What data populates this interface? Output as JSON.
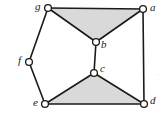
{
  "figure": {
    "kind": "planar-graph-drawing",
    "width": 167,
    "height": 120,
    "background_color": "#ffffff",
    "edge_color": "#1a1a1a",
    "node_fill_color": "#ffffff",
    "node_stroke_color": "#1a1a1a",
    "shade_color": "#d9d9d9"
  },
  "nodes": [
    {
      "id": "g",
      "label": "g",
      "x": 48,
      "y": 8,
      "r": 3.4,
      "label_x": 35,
      "label_y": 1
    },
    {
      "id": "a",
      "label": "a",
      "x": 143,
      "y": 9,
      "r": 3.4,
      "label_x": 150,
      "label_y": 2
    },
    {
      "id": "b",
      "label": "b",
      "x": 96,
      "y": 42,
      "r": 3.4,
      "label_x": 101,
      "label_y": 39
    },
    {
      "id": "f",
      "label": "f",
      "x": 29,
      "y": 62,
      "r": 3.4,
      "label_x": 18,
      "label_y": 55
    },
    {
      "id": "c",
      "label": "c",
      "x": 94,
      "y": 73,
      "r": 3.4,
      "label_x": 100,
      "label_y": 63
    },
    {
      "id": "e",
      "label": "e",
      "x": 45,
      "y": 104,
      "r": 3.4,
      "label_x": 33,
      "label_y": 97
    },
    {
      "id": "d",
      "label": "d",
      "x": 144,
      "y": 104,
      "r": 3.4,
      "label_x": 150,
      "label_y": 95
    }
  ],
  "edges": [
    {
      "id": "g-a",
      "from": "g",
      "to": "a"
    },
    {
      "id": "g-b",
      "from": "g",
      "to": "b"
    },
    {
      "id": "a-b",
      "from": "a",
      "to": "b"
    },
    {
      "id": "b-c",
      "from": "b",
      "to": "c"
    },
    {
      "id": "c-e",
      "from": "c",
      "to": "e"
    },
    {
      "id": "c-d",
      "from": "c",
      "to": "d"
    },
    {
      "id": "e-d",
      "from": "e",
      "to": "d"
    },
    {
      "id": "a-d",
      "from": "a",
      "to": "d"
    },
    {
      "id": "g-f",
      "from": "g",
      "to": "f"
    },
    {
      "id": "f-e",
      "from": "f",
      "to": "e"
    }
  ],
  "shaded_faces": [
    {
      "id": "face-gab",
      "nodes": [
        "g",
        "a",
        "b"
      ]
    },
    {
      "id": "face-ced",
      "nodes": [
        "c",
        "e",
        "d"
      ]
    }
  ],
  "stray_marks": [
    {
      "id": "margin-speck",
      "text": "·",
      "x": 157,
      "y": 72
    }
  ]
}
